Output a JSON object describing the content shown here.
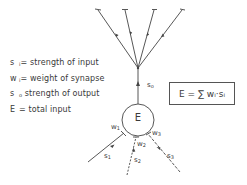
{
  "legend": {
    "items": [
      {
        "symbol": "s",
        "sub": "i",
        "sep": "=",
        "text": "strength of input"
      },
      {
        "symbol": "w",
        "sub": "i",
        "sep": "=",
        "text": "weight of synapse"
      },
      {
        "symbol": "s",
        "sub": "o",
        "sep": "",
        "text": "strength of output"
      },
      {
        "symbol": "E",
        "sub": "",
        "sep": "=",
        "text": "total input"
      }
    ]
  },
  "formula": {
    "text": "E  =  ∑ wᵢ·sᵢ"
  },
  "node": {
    "label": "E"
  },
  "output": {
    "label": "s",
    "sub": "o",
    "branches": 4
  },
  "inputs": [
    {
      "weight": "w",
      "weight_sub": "1",
      "signal": "s",
      "signal_sub": "1"
    },
    {
      "weight": "w",
      "weight_sub": "2",
      "signal": "s",
      "signal_sub": "2"
    },
    {
      "weight": "w",
      "weight_sub": "3",
      "signal": "s",
      "signal_sub": "3"
    }
  ],
  "colors": {
    "stroke": "#444444",
    "text": "#3a3a3a",
    "background": "#ffffff"
  }
}
